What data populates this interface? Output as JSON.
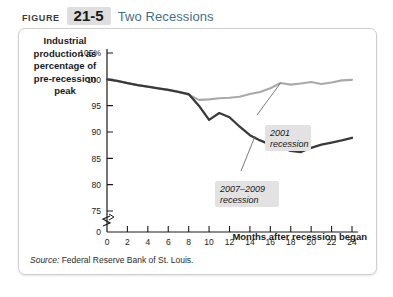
{
  "header": {
    "figure_word": "FIGURE",
    "figure_number": "21-5",
    "title": "Two Recessions"
  },
  "panel": {
    "y_axis_caption": "Industrial production as percentage of pre-recession peak",
    "x_axis_caption": "Months after recession began",
    "source": "Source:",
    "source_text": " Federal Reserve Bank of St. Louis."
  },
  "colors": {
    "series_2001": "#a9a9a9",
    "series_2007": "#3a3a3a",
    "axis": "#1a1a1a",
    "callout_bg": "#e2e2e2",
    "title_blue": "#3f6f86",
    "badge_bg": "#dedede"
  },
  "chart_data": {
    "type": "line",
    "title": "Two Recessions",
    "xlabel": "Months after recession began",
    "ylabel": "Industrial production as percentage of pre-recession peak",
    "xlim": [
      0,
      24
    ],
    "ylim": [
      75,
      105
    ],
    "y_axis_break": true,
    "y_break_value": 0,
    "grid": false,
    "legend": "annotations",
    "xticks": [
      0,
      2,
      4,
      6,
      8,
      10,
      12,
      14,
      16,
      18,
      20,
      22,
      24
    ],
    "xtick_labels": [
      "0",
      "2",
      "4",
      "6",
      "8",
      "10",
      "12",
      "14",
      "16",
      "18",
      "20",
      "22",
      "24"
    ],
    "yticks": [
      75,
      80,
      85,
      90,
      95,
      100,
      105
    ],
    "ytick_labels": [
      "75",
      "80",
      "85",
      "90",
      "95",
      "100",
      "105%"
    ],
    "x": [
      0,
      1,
      2,
      3,
      4,
      5,
      6,
      7,
      8,
      9,
      10,
      11,
      12,
      13,
      14,
      15,
      16,
      17,
      18,
      19,
      20,
      21,
      22,
      23,
      24
    ],
    "series": [
      {
        "name": "2001 recession",
        "color": "#a9a9a9",
        "annotation": "2001\nrecession",
        "values": [
          100.0,
          99.7,
          99.3,
          98.9,
          98.6,
          98.3,
          98.0,
          97.6,
          97.1,
          96.1,
          96.2,
          96.4,
          96.5,
          96.7,
          97.2,
          97.6,
          98.3,
          99.3,
          99.0,
          99.2,
          99.5,
          99.1,
          99.4,
          99.8,
          99.9
        ]
      },
      {
        "name": "2007-2009 recession",
        "color": "#3a3a3a",
        "annotation": "2007–2009\nrecession",
        "values": [
          100.0,
          99.7,
          99.3,
          98.9,
          98.6,
          98.3,
          98.0,
          97.6,
          97.2,
          95.0,
          92.3,
          93.6,
          92.8,
          91.0,
          89.4,
          88.4,
          87.6,
          87.1,
          86.4,
          86.2,
          87.0,
          87.6,
          88.0,
          88.4,
          88.9
        ]
      }
    ],
    "annotations": [
      {
        "label": "2001 recession",
        "line1": "2001",
        "line2": "recession",
        "points_to_x": 17,
        "points_to_y": 99.3
      },
      {
        "label": "2007-2009 recession",
        "line1": "2007–2009",
        "line2": "recession",
        "points_to_x": 14.5,
        "points_to_y": 89.2
      }
    ]
  }
}
